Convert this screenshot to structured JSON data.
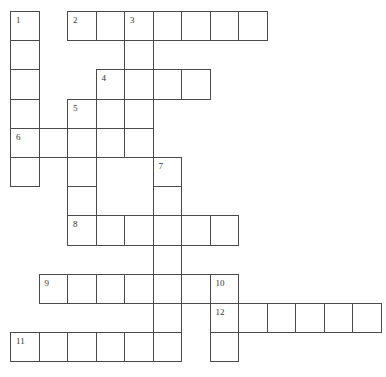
{
  "puzzle": {
    "type": "crossword",
    "title_fragment": "",
    "colors": {
      "line": "#4a4a4a",
      "cell_bg": "#ffffff",
      "number": "#333333"
    },
    "grid": {
      "origin_x": 10,
      "origin_y": 11,
      "cell_w": 28.5,
      "cell_h": 29.2,
      "cols": 13,
      "rows": 12
    },
    "cells": [
      {
        "r": 0,
        "c": 0,
        "n": "1"
      },
      {
        "r": 0,
        "c": 2,
        "n": "2"
      },
      {
        "r": 0,
        "c": 3
      },
      {
        "r": 0,
        "c": 4,
        "n": "3"
      },
      {
        "r": 0,
        "c": 5
      },
      {
        "r": 0,
        "c": 6
      },
      {
        "r": 0,
        "c": 7
      },
      {
        "r": 0,
        "c": 8
      },
      {
        "r": 1,
        "c": 0
      },
      {
        "r": 1,
        "c": 4
      },
      {
        "r": 2,
        "c": 0
      },
      {
        "r": 2,
        "c": 3,
        "n": "4"
      },
      {
        "r": 2,
        "c": 4
      },
      {
        "r": 2,
        "c": 5
      },
      {
        "r": 2,
        "c": 6
      },
      {
        "r": 3,
        "c": 0
      },
      {
        "r": 3,
        "c": 2,
        "n": "5"
      },
      {
        "r": 3,
        "c": 3
      },
      {
        "r": 3,
        "c": 4
      },
      {
        "r": 4,
        "c": 0,
        "n": "6"
      },
      {
        "r": 4,
        "c": 1
      },
      {
        "r": 4,
        "c": 2
      },
      {
        "r": 4,
        "c": 3
      },
      {
        "r": 4,
        "c": 4
      },
      {
        "r": 5,
        "c": 0
      },
      {
        "r": 5,
        "c": 2
      },
      {
        "r": 5,
        "c": 5,
        "n": "7"
      },
      {
        "r": 6,
        "c": 2
      },
      {
        "r": 6,
        "c": 5
      },
      {
        "r": 7,
        "c": 2,
        "n": "8"
      },
      {
        "r": 7,
        "c": 3
      },
      {
        "r": 7,
        "c": 4
      },
      {
        "r": 7,
        "c": 5
      },
      {
        "r": 7,
        "c": 6
      },
      {
        "r": 7,
        "c": 7
      },
      {
        "r": 8,
        "c": 5
      },
      {
        "r": 9,
        "c": 1,
        "n": "9"
      },
      {
        "r": 9,
        "c": 2
      },
      {
        "r": 9,
        "c": 3
      },
      {
        "r": 9,
        "c": 4
      },
      {
        "r": 9,
        "c": 5
      },
      {
        "r": 9,
        "c": 6
      },
      {
        "r": 9,
        "c": 7,
        "n": "10"
      },
      {
        "r": 10,
        "c": 5
      },
      {
        "r": 10,
        "c": 7,
        "n": "12"
      },
      {
        "r": 10,
        "c": 8
      },
      {
        "r": 10,
        "c": 9
      },
      {
        "r": 10,
        "c": 10
      },
      {
        "r": 10,
        "c": 11
      },
      {
        "r": 10,
        "c": 12
      },
      {
        "r": 11,
        "c": 0,
        "n": "11"
      },
      {
        "r": 11,
        "c": 1
      },
      {
        "r": 11,
        "c": 2
      },
      {
        "r": 11,
        "c": 3
      },
      {
        "r": 11,
        "c": 4
      },
      {
        "r": 11,
        "c": 5
      },
      {
        "r": 11,
        "c": 7
      }
    ],
    "entries": {
      "across": [
        {
          "number": "2",
          "length": 7
        },
        {
          "number": "4",
          "length": 4
        },
        {
          "number": "6",
          "length": 5
        },
        {
          "number": "8",
          "length": 6
        },
        {
          "number": "9",
          "length": 7
        },
        {
          "number": "11",
          "length": 6
        },
        {
          "number": "12",
          "length": 6
        }
      ],
      "down": [
        {
          "number": "1",
          "length": 6
        },
        {
          "number": "3",
          "length": 5
        },
        {
          "number": "5",
          "length": 5
        },
        {
          "number": "7",
          "length": 7
        },
        {
          "number": "10",
          "length": 3
        }
      ]
    }
  }
}
